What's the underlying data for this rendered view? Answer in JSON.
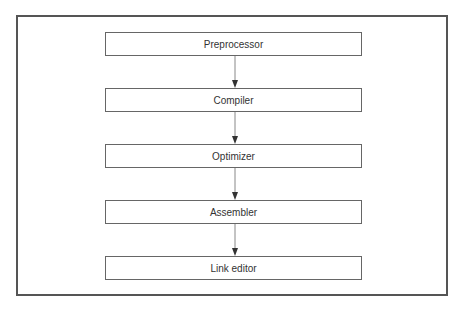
{
  "diagram": {
    "stages": [
      {
        "label": "Preprocessor"
      },
      {
        "label": "Compiler"
      },
      {
        "label": "Optimizer"
      },
      {
        "label": "Assembler"
      },
      {
        "label": "Link editor"
      }
    ],
    "edges": [
      {
        "from": "Preprocessor",
        "to": "Compiler"
      },
      {
        "from": "Compiler",
        "to": "Optimizer"
      },
      {
        "from": "Optimizer",
        "to": "Assembler"
      },
      {
        "from": "Assembler",
        "to": "Link editor"
      }
    ],
    "colors": {
      "border": "#555555",
      "line": "#888888",
      "text": "#333333"
    }
  }
}
